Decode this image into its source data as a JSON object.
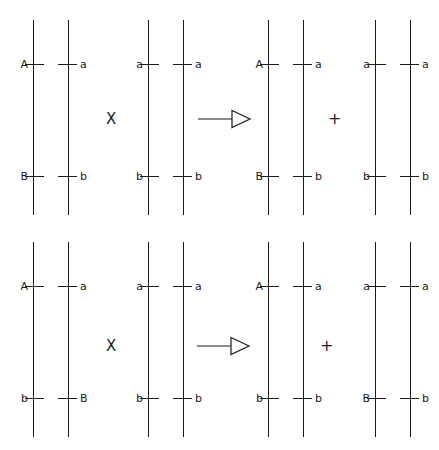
{
  "diagram": {
    "stroke_color": "#1a1a1a",
    "background_color": "#ffffff",
    "operators": {
      "cross": "X",
      "plus": "+",
      "arrow": "arrow-right-hollow"
    },
    "rows": [
      {
        "id": "row-coupling",
        "panels": [
          {
            "id": "r1p1",
            "upper": {
              "left": "A",
              "right": "a"
            },
            "lower": {
              "left": "B",
              "right": "b"
            }
          },
          {
            "id": "r1p2",
            "upper": {
              "left": "a",
              "right": "a"
            },
            "lower": {
              "left": "b",
              "right": "b"
            }
          },
          {
            "id": "r1p3",
            "upper": {
              "left": "A",
              "right": "a"
            },
            "lower": {
              "left": "B",
              "right": "b"
            }
          },
          {
            "id": "r1p4",
            "upper": {
              "left": "a",
              "right": "a"
            },
            "lower": {
              "left": "b",
              "right": "b"
            }
          }
        ]
      },
      {
        "id": "row-repulsion",
        "panels": [
          {
            "id": "r2p1",
            "upper": {
              "left": "A",
              "right": "a"
            },
            "lower": {
              "left": "b",
              "right": "B"
            }
          },
          {
            "id": "r2p2",
            "upper": {
              "left": "a",
              "right": "a"
            },
            "lower": {
              "left": "b",
              "right": "b"
            }
          },
          {
            "id": "r2p3",
            "upper": {
              "left": "A",
              "right": "a"
            },
            "lower": {
              "left": "b",
              "right": "b"
            }
          },
          {
            "id": "r2p4",
            "upper": {
              "left": "a",
              "right": "a"
            },
            "lower": {
              "left": "B",
              "right": "b"
            }
          }
        ]
      }
    ]
  }
}
